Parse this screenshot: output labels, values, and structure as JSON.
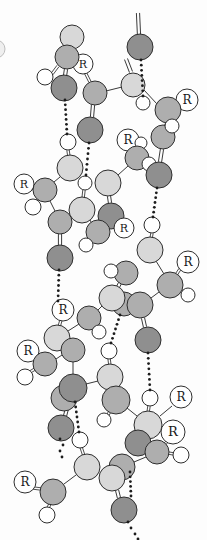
{
  "figure": {
    "width": 207,
    "height": 540,
    "r_label": "R",
    "colors": {
      "background": "#fdfdfd",
      "light_atom": "#d8d8d8",
      "medium_atom": "#aeaeae",
      "dark_atom": "#8f8f8f",
      "hydrogen_atom": "#ffffff",
      "r_circle": "#ffffff",
      "outline": "#2e2e2e",
      "bond": "#3a3a3a",
      "hbond_dot": "#1c1c1c",
      "edge_fragment": "#bdbdbd"
    },
    "edge_fragment_circle": {
      "x": -4,
      "y": 49,
      "r": 9
    },
    "bonds_single": [
      [
        106,
        91,
        122,
        87
      ],
      [
        144,
        90,
        157,
        104
      ],
      [
        166,
        122,
        164,
        127
      ],
      [
        128,
        166,
        118,
        175
      ],
      [
        60,
        177,
        54,
        182
      ],
      [
        50,
        201,
        55,
        211
      ],
      [
        90,
        220,
        91,
        222
      ],
      [
        156,
        261,
        164,
        274
      ],
      [
        159,
        292,
        151,
        298
      ],
      [
        102,
        306,
        98,
        310
      ],
      [
        79,
        324,
        68,
        331
      ],
      [
        56,
        359,
        62,
        355
      ],
      [
        73,
        362,
        73,
        374
      ],
      [
        86,
        384,
        98,
        381
      ],
      [
        127,
        408,
        137,
        416
      ],
      [
        146,
        457,
        134,
        462
      ],
      [
        76,
        475,
        64,
        484
      ],
      [
        172,
        406,
        160,
        416
      ]
    ],
    "bonds_double": [
      [
        66,
        69,
        65,
        76
      ],
      [
        138,
        13,
        139,
        35
      ],
      [
        126,
        59,
        131,
        72
      ],
      [
        93,
        105,
        92,
        117
      ],
      [
        162,
        149,
        160,
        162
      ],
      [
        109,
        196,
        110,
        203
      ],
      [
        60,
        234,
        60,
        245
      ],
      [
        120,
        283,
        118,
        287
      ],
      [
        143,
        318,
        145,
        327
      ],
      [
        69,
        401,
        65,
        416
      ],
      [
        117,
        490,
        119,
        498
      ]
    ],
    "stick_bonds": [
      [
        52,
        74,
        58,
        66
      ],
      [
        90,
        82,
        85,
        72
      ],
      [
        174,
        107,
        179,
        103
      ],
      [
        171,
        121,
        170,
        117
      ],
      [
        68,
        150,
        69,
        157
      ],
      [
        31,
        188,
        35,
        189
      ],
      [
        37,
        201,
        41,
        196
      ],
      [
        84,
        190,
        83,
        199
      ],
      [
        89,
        240,
        93,
        237
      ],
      [
        152,
        233,
        151,
        239
      ],
      [
        180,
        269,
        176,
        275
      ],
      [
        183,
        292,
        179,
        289
      ],
      [
        61,
        320,
        59,
        327
      ],
      [
        95,
        328,
        92,
        325
      ],
      [
        34,
        355,
        38,
        358
      ],
      [
        30,
        372,
        35,
        369
      ],
      [
        109,
        358,
        110,
        366
      ],
      [
        108,
        415,
        111,
        409
      ],
      [
        149,
        406,
        148,
        413
      ],
      [
        132,
        147,
        135,
        150
      ],
      [
        81,
        447,
        84,
        456
      ],
      [
        33,
        488,
        41,
        489
      ],
      [
        48,
        508,
        51,
        502
      ],
      [
        174,
        454,
        168,
        453
      ],
      [
        167,
        442,
        162,
        446
      ]
    ],
    "hbonds_dotted": [
      [
        65,
        100,
        67,
        134
      ],
      [
        141,
        60,
        143,
        96
      ],
      [
        89,
        143,
        86,
        175
      ],
      [
        157,
        188,
        153,
        217
      ],
      [
        59,
        270,
        58,
        301
      ],
      [
        148,
        353,
        150,
        390
      ],
      [
        120,
        315,
        111,
        343
      ],
      [
        75,
        402,
        79,
        432
      ],
      [
        130,
        472,
        131,
        496
      ]
    ],
    "dot_trails": [
      [
        [
          60,
          439
        ],
        [
          63,
          445
        ],
        [
          60,
          451
        ],
        [
          62,
          457
        ]
      ],
      [
        [
          128,
          522
        ],
        [
          131,
          528
        ],
        [
          135,
          534
        ],
        [
          138,
          539
        ]
      ]
    ],
    "nodes": [
      {
        "kind": "light",
        "x": 72,
        "y": 37,
        "r": 12
      },
      {
        "kind": "R",
        "x": 83,
        "y": 64,
        "r": 10
      },
      {
        "kind": "medium",
        "x": 67,
        "y": 57,
        "r": 12
      },
      {
        "kind": "h",
        "x": 45,
        "y": 77,
        "r": 8
      },
      {
        "kind": "dark",
        "x": 64,
        "y": 88,
        "r": 13
      },
      {
        "kind": "medium",
        "x": 95,
        "y": 93,
        "r": 12
      },
      {
        "kind": "light",
        "x": 133,
        "y": 85,
        "r": 12
      },
      {
        "kind": "dark",
        "x": 140,
        "y": 47,
        "r": 13
      },
      {
        "kind": "h",
        "x": 143,
        "y": 103,
        "r": 7
      },
      {
        "kind": "R",
        "x": 187,
        "y": 100,
        "r": 11
      },
      {
        "kind": "medium",
        "x": 168,
        "y": 110,
        "r": 13
      },
      {
        "kind": "medium",
        "x": 163,
        "y": 137,
        "r": 12
      },
      {
        "kind": "h",
        "x": 172,
        "y": 126,
        "r": 7
      },
      {
        "kind": "dark",
        "x": 90,
        "y": 130,
        "r": 13
      },
      {
        "kind": "R",
        "x": 128,
        "y": 140,
        "r": 11
      },
      {
        "kind": "h",
        "x": 141,
        "y": 143,
        "r": 6
      },
      {
        "kind": "medium",
        "x": 137,
        "y": 158,
        "r": 12
      },
      {
        "kind": "h",
        "x": 149,
        "y": 164,
        "r": 7
      },
      {
        "kind": "dark",
        "x": 159,
        "y": 175,
        "r": 13
      },
      {
        "kind": "h",
        "x": 68,
        "y": 142,
        "r": 8
      },
      {
        "kind": "light",
        "x": 70,
        "y": 168,
        "r": 13
      },
      {
        "kind": "h",
        "x": 85,
        "y": 183,
        "r": 7
      },
      {
        "kind": "R",
        "x": 24,
        "y": 184,
        "r": 10
      },
      {
        "kind": "medium",
        "x": 45,
        "y": 190,
        "r": 12
      },
      {
        "kind": "h",
        "x": 33,
        "y": 207,
        "r": 8
      },
      {
        "kind": "light",
        "x": 108,
        "y": 183,
        "r": 13
      },
      {
        "kind": "light",
        "x": 82,
        "y": 210,
        "r": 13
      },
      {
        "kind": "medium",
        "x": 60,
        "y": 222,
        "r": 12
      },
      {
        "kind": "dark",
        "x": 111,
        "y": 216,
        "r": 13
      },
      {
        "kind": "R",
        "x": 124,
        "y": 228,
        "r": 10
      },
      {
        "kind": "medium",
        "x": 98,
        "y": 232,
        "r": 12
      },
      {
        "kind": "h",
        "x": 86,
        "y": 245,
        "r": 7
      },
      {
        "kind": "dark",
        "x": 60,
        "y": 258,
        "r": 13
      },
      {
        "kind": "h",
        "x": 152,
        "y": 225,
        "r": 8
      },
      {
        "kind": "light",
        "x": 150,
        "y": 250,
        "r": 13
      },
      {
        "kind": "R",
        "x": 188,
        "y": 262,
        "r": 11
      },
      {
        "kind": "medium",
        "x": 170,
        "y": 285,
        "r": 13
      },
      {
        "kind": "h",
        "x": 188,
        "y": 295,
        "r": 7
      },
      {
        "kind": "medium",
        "x": 126,
        "y": 273,
        "r": 12
      },
      {
        "kind": "h",
        "x": 111,
        "y": 271,
        "r": 7
      },
      {
        "kind": "medium",
        "x": 124,
        "y": 304,
        "r": 12
      },
      {
        "kind": "light",
        "x": 112,
        "y": 298,
        "r": 13
      },
      {
        "kind": "medium",
        "x": 140,
        "y": 305,
        "r": 13
      },
      {
        "kind": "dark",
        "x": 148,
        "y": 340,
        "r": 13
      },
      {
        "kind": "R",
        "x": 63,
        "y": 310,
        "r": 11
      },
      {
        "kind": "medium",
        "x": 89,
        "y": 318,
        "r": 12
      },
      {
        "kind": "h",
        "x": 99,
        "y": 332,
        "r": 7
      },
      {
        "kind": "light",
        "x": 57,
        "y": 338,
        "r": 13
      },
      {
        "kind": "medium",
        "x": 73,
        "y": 350,
        "r": 12
      },
      {
        "kind": "R",
        "x": 28,
        "y": 351,
        "r": 11
      },
      {
        "kind": "medium",
        "x": 45,
        "y": 364,
        "r": 12
      },
      {
        "kind": "h",
        "x": 25,
        "y": 377,
        "r": 8
      },
      {
        "kind": "medium",
        "x": 64,
        "y": 398,
        "r": 13
      },
      {
        "kind": "dark",
        "x": 73,
        "y": 388,
        "r": 14
      },
      {
        "kind": "dark",
        "x": 61,
        "y": 428,
        "r": 13
      },
      {
        "kind": "h",
        "x": 109,
        "y": 351,
        "r": 8
      },
      {
        "kind": "light",
        "x": 110,
        "y": 377,
        "r": 13
      },
      {
        "kind": "medium",
        "x": 116,
        "y": 400,
        "r": 14
      },
      {
        "kind": "h",
        "x": 104,
        "y": 420,
        "r": 7
      },
      {
        "kind": "h",
        "x": 150,
        "y": 398,
        "r": 8
      },
      {
        "kind": "R",
        "x": 181,
        "y": 397,
        "r": 11
      },
      {
        "kind": "light",
        "x": 148,
        "y": 425,
        "r": 14
      },
      {
        "kind": "R",
        "x": 173,
        "y": 432,
        "r": 12
      },
      {
        "kind": "dark",
        "x": 138,
        "y": 443,
        "r": 13
      },
      {
        "kind": "medium",
        "x": 157,
        "y": 452,
        "r": 12
      },
      {
        "kind": "h",
        "x": 181,
        "y": 455,
        "r": 8
      },
      {
        "kind": "medium",
        "x": 122,
        "y": 467,
        "r": 13
      },
      {
        "kind": "h",
        "x": 80,
        "y": 440,
        "r": 8
      },
      {
        "kind": "light",
        "x": 87,
        "y": 467,
        "r": 13
      },
      {
        "kind": "R",
        "x": 25,
        "y": 482,
        "r": 11
      },
      {
        "kind": "medium",
        "x": 53,
        "y": 492,
        "r": 13
      },
      {
        "kind": "h",
        "x": 47,
        "y": 515,
        "r": 8
      },
      {
        "kind": "light",
        "x": 112,
        "y": 478,
        "r": 13
      },
      {
        "kind": "dark",
        "x": 124,
        "y": 510,
        "r": 13
      }
    ]
  }
}
